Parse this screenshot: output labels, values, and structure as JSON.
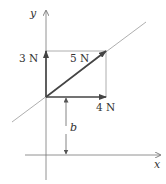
{
  "diagram": {
    "axes": {
      "x_label": "x",
      "y_label": "y"
    },
    "vectors": [
      {
        "name": "horizontal",
        "label": "4 N"
      },
      {
        "name": "vertical",
        "label": "3 N"
      },
      {
        "name": "resultant",
        "label": "5 N"
      }
    ],
    "distance_label": "b",
    "colors": {
      "vector": "#444444",
      "line": "#888888",
      "axis": "#666666"
    }
  }
}
